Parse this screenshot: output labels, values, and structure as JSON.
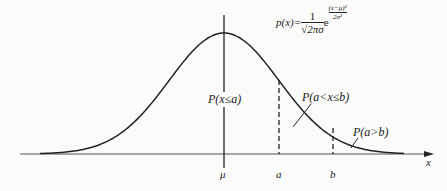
{
  "chart_data": {
    "type": "line",
    "title": "",
    "formula": {
      "lhs": "p(x)=",
      "coef_num": "1",
      "coef_den": "√2πσ",
      "base": "e",
      "exp_num": "(x−μ)²",
      "exp_den": "2σ²",
      "exp_sign": "−"
    },
    "xlabel": "x",
    "x_ticks": [
      "μ",
      "a",
      "b"
    ],
    "annotations": [
      "P(x≤a)",
      "P(a<x≤b)",
      "P(a>b)"
    ],
    "grid": false,
    "legend": null
  },
  "labels": {
    "axis_x": "x",
    "mu": "μ",
    "a": "a",
    "b": "b",
    "p_le_a": "P(x≤a)",
    "p_a_b": "P(a<x≤b)",
    "p_gt_b": "P(a>b)"
  },
  "colors": {
    "line": "#222222",
    "axis": "#555555",
    "background": "#fbfbf9"
  }
}
